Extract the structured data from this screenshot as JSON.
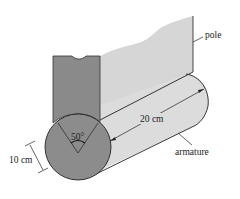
{
  "diagram": {
    "labels": {
      "pole": "pole",
      "armature": "armature",
      "length": "20 cm",
      "radius": "10 cm",
      "angle": "50°"
    },
    "colors": {
      "pole_front": "#8a8a8a",
      "pole_side": "#d6d6d6",
      "armature_end": "#8c8c8c",
      "armature_body": "#dcdcdc",
      "line": "#222222",
      "background": "#ffffff"
    }
  }
}
